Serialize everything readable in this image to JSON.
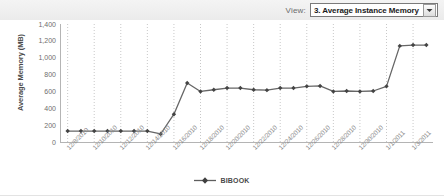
{
  "toolbar": {
    "view_label": "View:",
    "selected_option": "3. Average Instance Memory",
    "dropdown_arrow_icon": "chevron-down-icon",
    "options": [
      "3. Average Instance Memory"
    ]
  },
  "legend": {
    "series_label": "BIBOOK",
    "marker_icon": "line-diamond-marker-icon"
  },
  "chart_data": {
    "type": "line",
    "title": "",
    "xlabel": "",
    "ylabel": "Average Memory (MB)",
    "ylim": [
      0,
      1400
    ],
    "ytick_labels": [
      "1,400",
      "1,200",
      "1,000",
      "800",
      "600",
      "400",
      "200",
      "0"
    ],
    "ytick_values": [
      1400,
      1200,
      1000,
      800,
      600,
      400,
      200,
      0
    ],
    "grid": "vertical-dotted",
    "legend_position": "bottom-center",
    "line_color": "#666666",
    "marker_color": "#444444",
    "grid_color": "#c8c8c8",
    "axis_color": "#b4b4b4",
    "x": [
      "12/8/2010",
      "12/9/2010",
      "12/10/2010",
      "12/11/2010",
      "12/12/2010",
      "12/13/2010",
      "12/14/2010",
      "12/15/2010",
      "12/16/2010",
      "12/17/2010",
      "12/18/2010",
      "12/19/2010",
      "12/20/2010",
      "12/21/2010",
      "12/22/2010",
      "12/23/2010",
      "12/24/2010",
      "12/25/2010",
      "12/26/2010",
      "12/27/2010",
      "12/28/2010",
      "12/29/2010",
      "12/30/2010",
      "12/31/2010",
      "1/1/2011",
      "1/2/2011",
      "1/3/2011",
      "1/4/2011"
    ],
    "xtick_labels": [
      "12/8/2010",
      "12/10/2010",
      "12/12/2010",
      "12/14/2010",
      "12/16/2010",
      "12/18/2010",
      "12/20/2010",
      "12/22/2010",
      "12/24/2010",
      "12/26/2010",
      "12/28/2010",
      "12/30/2010",
      "1/1/2011",
      "1/3/2011"
    ],
    "xtick_indices": [
      0,
      2,
      4,
      6,
      8,
      10,
      12,
      14,
      16,
      18,
      20,
      22,
      24,
      26
    ],
    "series": [
      {
        "name": "BIBOOK",
        "values": [
          130,
          130,
          130,
          130,
          130,
          130,
          130,
          95,
          330,
          700,
          600,
          620,
          640,
          640,
          620,
          615,
          640,
          640,
          660,
          665,
          600,
          605,
          600,
          605,
          660,
          1140,
          1150,
          1150
        ]
      }
    ]
  }
}
